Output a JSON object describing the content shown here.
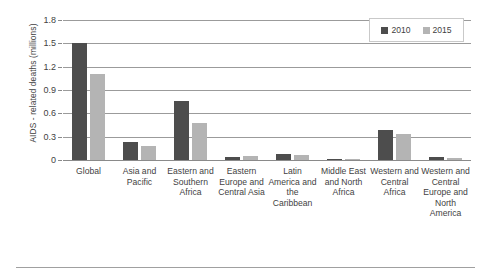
{
  "chart_data": {
    "type": "bar",
    "title": "",
    "xlabel": "",
    "ylabel": "AIDS - related deaths (millions)",
    "ylim": [
      0,
      1.8
    ],
    "yticks": [
      "0",
      "0.3",
      "0.6",
      "0.9",
      "1.2",
      "1.5",
      "1.8"
    ],
    "ytick_values": [
      0,
      0.3,
      0.6,
      0.9,
      1.2,
      1.5,
      1.8
    ],
    "grid": true,
    "legend_position": "top-right",
    "categories": [
      "Global",
      "Asia and Pacific",
      "Eastern and Southern Africa",
      "Eastern Europe and Central Asia",
      "Latin America and the Caribbean",
      "Middle East and North Africa",
      "Western and Central Africa",
      "Western and Central Europe and North America"
    ],
    "series": [
      {
        "name": "2010",
        "color": "#4d4d4d",
        "values": [
          1.5,
          0.23,
          0.76,
          0.04,
          0.08,
          0.012,
          0.38,
          0.04
        ]
      },
      {
        "name": "2015",
        "color": "#b4b4b4",
        "values": [
          1.1,
          0.18,
          0.48,
          0.05,
          0.06,
          0.012,
          0.34,
          0.03
        ]
      }
    ]
  },
  "legend": {
    "items": [
      {
        "label": "2010",
        "series": "s2010"
      },
      {
        "label": "2015",
        "series": "s2015"
      }
    ]
  },
  "colors": {
    "series_2010": "#4d4d4d",
    "series_2015": "#b4b4b4",
    "gridline": "#9b9b9b",
    "text": "#3f3f3f",
    "legend_border": "#c9c9c9"
  }
}
